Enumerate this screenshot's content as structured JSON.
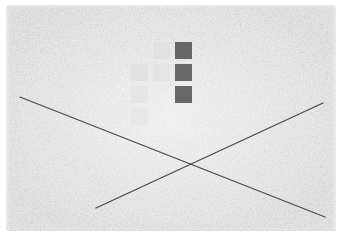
{
  "scene": {
    "width": 342,
    "height": 238,
    "background_color": "#ffffff",
    "canvas_color": "#eeeeee",
    "title": "Abstract Texture Composition",
    "description": "Mottled light-gray noise field with two crossing diagonal dark lines and a stepped arrangement of gray squares"
  },
  "texture": {
    "name": "mottled-paper-noise",
    "base_color": "#ededed",
    "speckle_light": "#f8f8f8",
    "speckle_dark": "#d9d9d9",
    "grain_scale": "fine"
  },
  "lines": {
    "stroke_color": "#4a4a4a",
    "stroke_width": 1.3,
    "items": [
      {
        "name": "descending-diagonal",
        "label": "Descending diagonal",
        "x1": 20,
        "y1": 97,
        "x2": 325,
        "y2": 217,
        "color": "#4a4a4a"
      },
      {
        "name": "ascending-diagonal",
        "label": "Ascending diagonal",
        "x1": 96,
        "y1": 208,
        "x2": 323,
        "y2": 103,
        "color": "#4a4a4a"
      }
    ],
    "intersection": {
      "x": 190,
      "y": 161
    }
  },
  "squares": {
    "cell_size": 17,
    "light_color": "#e2e2e2",
    "dark_color": "#5c5c5c",
    "columns": [
      {
        "name": "left-column",
        "x": 131,
        "tone": "light"
      },
      {
        "name": "middle-column",
        "x": 153,
        "tone": "light"
      },
      {
        "name": "right-column",
        "x": 175,
        "tone": "dark"
      }
    ],
    "items": [
      {
        "name": "square-mid-r1",
        "col": "middle",
        "x": 153,
        "y": 20,
        "w": 17,
        "h": 17,
        "color": "#e4e4e4"
      },
      {
        "name": "square-mid-r2",
        "col": "middle",
        "x": 153,
        "y": 42,
        "w": 17,
        "h": 17,
        "color": "#e0e0e0"
      },
      {
        "name": "square-dark-r2",
        "col": "right",
        "x": 175,
        "y": 42,
        "w": 17,
        "h": 17,
        "color": "#5c5c5c"
      },
      {
        "name": "square-left-r3",
        "col": "left",
        "x": 131,
        "y": 64,
        "w": 17,
        "h": 17,
        "color": "#e1e1e1"
      },
      {
        "name": "square-mid-r3",
        "col": "middle",
        "x": 153,
        "y": 64,
        "w": 17,
        "h": 17,
        "color": "#e3e3e3"
      },
      {
        "name": "square-dark-r3",
        "col": "right",
        "x": 175,
        "y": 64,
        "w": 17,
        "h": 17,
        "color": "#5c5c5c"
      },
      {
        "name": "square-left-r4",
        "col": "left",
        "x": 131,
        "y": 86,
        "w": 17,
        "h": 17,
        "color": "#e4e4e4"
      },
      {
        "name": "square-dark-r4",
        "col": "right",
        "x": 175,
        "y": 86,
        "w": 17,
        "h": 17,
        "color": "#5c5c5c"
      },
      {
        "name": "square-left-r5",
        "col": "left",
        "x": 131,
        "y": 108,
        "w": 17,
        "h": 17,
        "color": "#e6e6e6"
      }
    ]
  }
}
